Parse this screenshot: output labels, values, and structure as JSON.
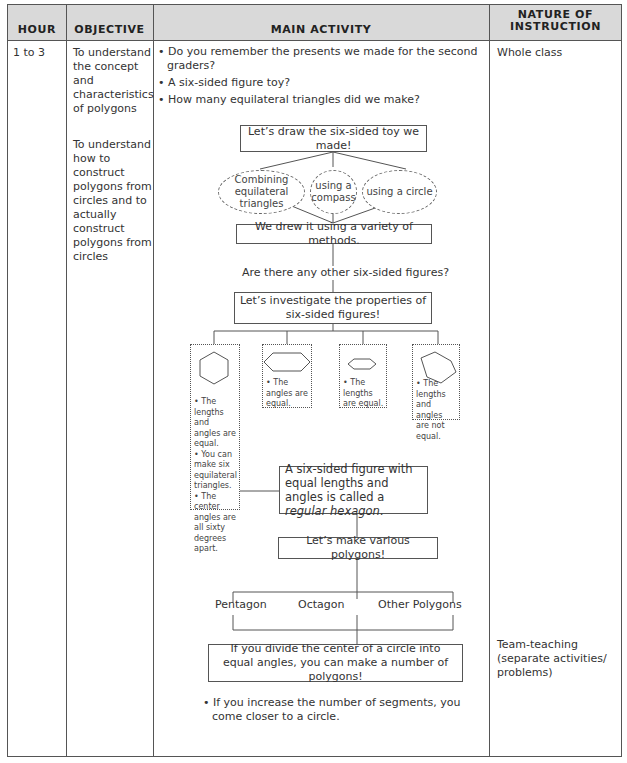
{
  "table": {
    "headers": {
      "hour": "HOUR",
      "objective": "OBJECTIVE",
      "main_activity": "MAIN ACTIVITY",
      "nature_line1": "NATURE OF",
      "nature_line2": "INSTRUCTION"
    },
    "row": {
      "hour": "1 to 3",
      "objectives": [
        "To understand the concept and characteristics of polygons",
        "To understand how to construct polygons from circles and to actually construct polygons from circles"
      ],
      "nature": [
        "Whole class",
        "Team-teaching (separate activities/ problems)"
      ]
    }
  },
  "activity": {
    "intro_bullets": [
      "Do you remember the presents we made for the second graders?",
      "A six-sided figure toy?",
      "How many equilateral triangles did we make?"
    ],
    "flow": {
      "draw_toy": "Let’s draw the six-sided toy we made!",
      "methods": [
        "Combining equilateral triangles",
        "using a compass",
        "using a circle"
      ],
      "drew_variety": "We drew it using a variety of methods.",
      "other_figures_question": "Are there any other six-sided figures?",
      "investigate": "Let’s investigate the properties of six-sided figures!",
      "figure_cards": [
        {
          "shape": "regular-hexagon",
          "text": [
            "• The lengths and angles are equal.",
            "• You can make six equilateral triangles.",
            "• The center angles are all sixty degrees apart."
          ]
        },
        {
          "shape": "wide-hexagon",
          "text": [
            "• The angles are equal."
          ]
        },
        {
          "shape": "small-flat-hexagon",
          "text": [
            "• The lengths are equal."
          ]
        },
        {
          "shape": "irregular-hexagon",
          "text": [
            "• The lengths and angles are not equal."
          ]
        }
      ],
      "regular_hexagon_def": "A six-sided figure with equal lengths and angles is called a",
      "regular_hexagon_term": "regular hexagon",
      "make_polygons": "Let’s make various polygons!",
      "polygon_types": [
        "Pentagon",
        "Octagon",
        "Other Polygons"
      ],
      "divide_circle": "If you divide the center of a circle into equal angles, you can make a number of polygons!"
    },
    "closing_bullet": "If you increase the number of segments, you come closer to a circle."
  },
  "colors": {
    "header_bg": "#d9d9d9",
    "border": "#555555",
    "text": "#333333"
  }
}
